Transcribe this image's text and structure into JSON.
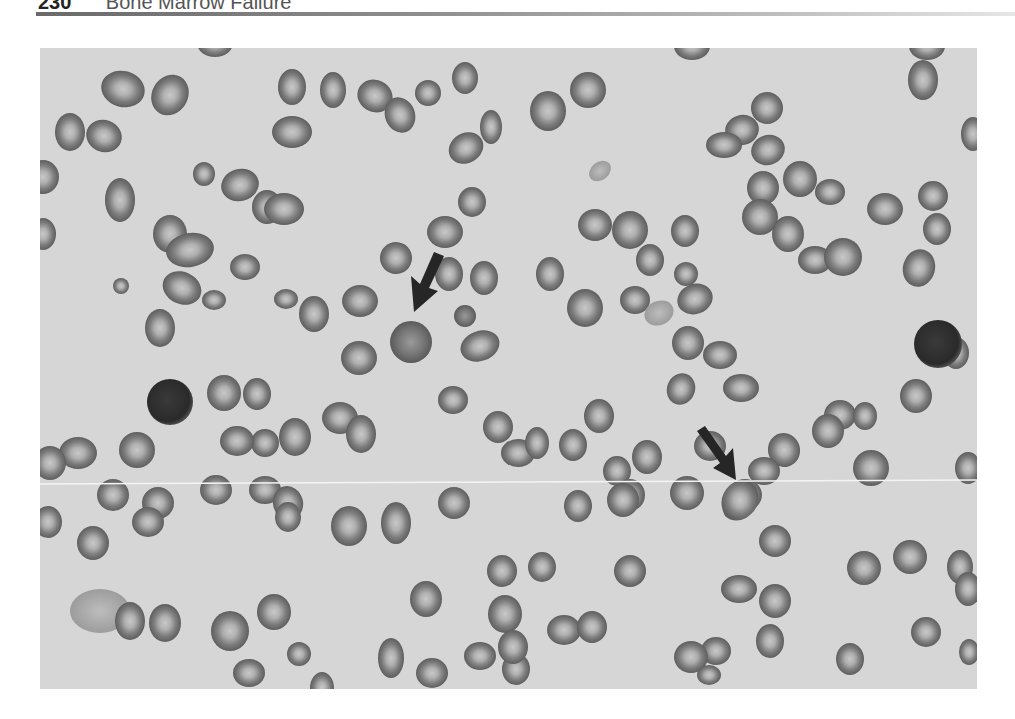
{
  "running_head": {
    "page_number": "230",
    "title": "Bone Marrow Failure"
  },
  "figure": {
    "type": "grayscale peripheral blood smear micrograph",
    "arrows": [
      {
        "label": "arrow-pointing-to-macrocyte",
        "direction": "down-left"
      },
      {
        "label": "arrow-pointing-to-teardrop-cell",
        "direction": "down-right"
      }
    ],
    "colors": {
      "background": "#d6d6d6",
      "cell_rim": "#6e6e6e",
      "cell_center": "#bcbcbc",
      "lymphocyte": "#2e2e2e",
      "arrow": "#262626"
    }
  }
}
